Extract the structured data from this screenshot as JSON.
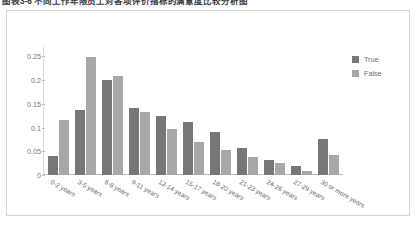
{
  "caption": {
    "text": "图表3-6  不同工作年限员工对各项评价指标的满意度比较分析图"
  },
  "legend": {
    "position": "right",
    "items": [
      {
        "label": "True",
        "color": "#777777"
      },
      {
        "label": "False",
        "color": "#a8a8a8"
      }
    ]
  },
  "axis": {
    "y_ticks": [
      "0",
      "0.05",
      "0.1",
      "0.15",
      "0.2",
      "0.25"
    ]
  },
  "chart_data": {
    "type": "bar",
    "title": "",
    "subtitle": "",
    "xlabel": "",
    "ylabel": "",
    "ylim": [
      0,
      0.27
    ],
    "yticks": [
      0,
      0.05,
      0.1,
      0.15,
      0.2,
      0.25
    ],
    "grid": false,
    "legend_position": "right",
    "categories": [
      "0-2 years",
      "3-5 years",
      "6-8 years",
      "9-11 years",
      "12-14 years",
      "15-17 years",
      "18-20 years",
      "21-23 years",
      "24-26 years",
      "27-29 years",
      "30 or more years"
    ],
    "series": [
      {
        "name": "True",
        "color": "#777777",
        "values": [
          0.04,
          0.138,
          0.2,
          0.142,
          0.124,
          0.111,
          0.09,
          0.058,
          0.032,
          0.019,
          0.075
        ]
      },
      {
        "name": "False",
        "color": "#a8a8a8",
        "values": [
          0.115,
          0.249,
          0.209,
          0.133,
          0.097,
          0.07,
          0.052,
          0.038,
          0.025,
          0.009,
          0.042
        ]
      }
    ]
  }
}
